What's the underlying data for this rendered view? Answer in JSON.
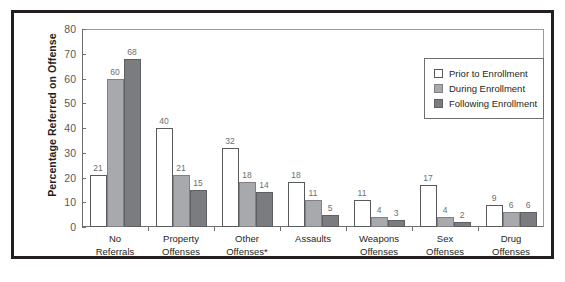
{
  "chart_data": {
    "type": "bar",
    "title": "",
    "xlabel": "",
    "ylabel": "Percentage Referred on Offense",
    "ylim": [
      0,
      80
    ],
    "yticks": [
      0,
      10,
      20,
      30,
      40,
      50,
      60,
      70,
      80
    ],
    "grid": false,
    "legend_position": "top-right",
    "categories": [
      "No Referrals",
      "Property Offenses",
      "Other Offenses*",
      "Assaults",
      "Weapons Offenses",
      "Sex Offenses",
      "Drug Offenses"
    ],
    "category_lines": [
      [
        "No",
        "Referrals"
      ],
      [
        "Property",
        "Offenses"
      ],
      [
        "Other",
        "Offenses*"
      ],
      [
        "Assaults",
        ""
      ],
      [
        "Weapons",
        "Offenses"
      ],
      [
        "Sex",
        "Offenses"
      ],
      [
        "Drug",
        "Offenses"
      ]
    ],
    "series": [
      {
        "name": "Prior to Enrollment",
        "color": "#ffffff",
        "values": [
          21,
          40,
          32,
          18,
          11,
          17,
          9
        ]
      },
      {
        "name": "During Enrollment",
        "color": "#a7a9ac",
        "values": [
          60,
          21,
          18,
          11,
          4,
          4,
          6
        ]
      },
      {
        "name": "Following Enrollment",
        "color": "#7b7c7f",
        "values": [
          68,
          15,
          14,
          5,
          3,
          2,
          6
        ]
      }
    ]
  },
  "legend": {
    "items": [
      {
        "label": "Prior to Enrollment"
      },
      {
        "label": "During Enrollment"
      },
      {
        "label": "Following Enrollment"
      }
    ]
  }
}
